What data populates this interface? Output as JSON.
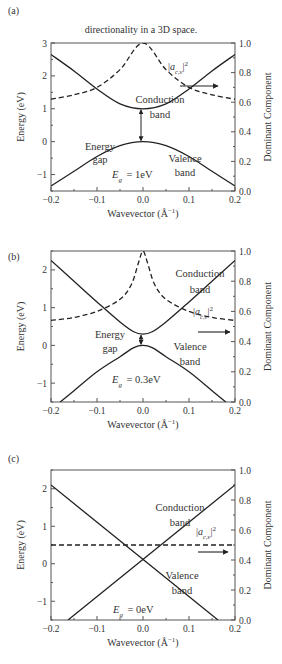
{
  "caption_top": "directionality in a 3D space.",
  "chart_data": [
    {
      "panel": "(a)",
      "type": "line",
      "xlabel": "Wavevector (Å⁻¹)",
      "ylabel": "Energy (eV)",
      "y2label": "Dominant Component",
      "xlim": [
        -0.2,
        0.2
      ],
      "ylim": [
        -1.5,
        3
      ],
      "y2lim": [
        0,
        1
      ],
      "xticks": [
        "-0.2",
        "-0.1",
        "0.0",
        "0.1",
        "0.2"
      ],
      "yticks": [
        "-1",
        "0",
        "1",
        "2",
        "3"
      ],
      "y2ticks": [
        "0.0",
        "0.2",
        "0.4",
        "0.6",
        "0.8",
        "1.0"
      ],
      "gap_eV": 1.0,
      "series": [
        {
          "name": "Conduction band",
          "style": "solid",
          "x": [
            -0.2,
            -0.15,
            -0.1,
            -0.05,
            0,
            0.05,
            0.1,
            0.15,
            0.2
          ],
          "y": [
            2.65,
            2.15,
            1.6,
            1.15,
            1.0,
            1.15,
            1.6,
            2.15,
            2.65
          ]
        },
        {
          "name": "Valence band",
          "style": "solid",
          "x": [
            -0.2,
            -0.15,
            -0.1,
            -0.05,
            0,
            0.05,
            0.1,
            0.15,
            0.2
          ],
          "y": [
            -1.35,
            -0.9,
            -0.45,
            -0.12,
            0.0,
            -0.12,
            -0.45,
            -0.9,
            -1.35
          ]
        },
        {
          "name": "|a_c,v|^2",
          "style": "dashed",
          "axis": "right",
          "x": [
            -0.2,
            -0.15,
            -0.1,
            -0.05,
            0,
            0.05,
            0.1,
            0.15,
            0.2
          ],
          "y": [
            0.62,
            0.65,
            0.7,
            0.82,
            1.0,
            0.82,
            0.7,
            0.65,
            0.62
          ]
        }
      ],
      "labels": {
        "conduction": [
          "Conduction",
          "band"
        ],
        "valence": [
          "Valence",
          "band"
        ],
        "gap": [
          "Energy",
          "gap"
        ],
        "eg": "= 1eV",
        "amp": "|a",
        "amp_sub": "c,v",
        "amp_sup": "2"
      }
    },
    {
      "panel": "(b)",
      "type": "line",
      "xlabel": "Wavevector (Å⁻¹)",
      "ylabel": "Energy (eV)",
      "y2label": "Dominant Component",
      "xlim": [
        -0.2,
        0.2
      ],
      "ylim": [
        -1.5,
        2.5
      ],
      "y2lim": [
        0,
        1
      ],
      "xticks": [
        "-0.2",
        "-0.1",
        "0.0",
        "0.1",
        "0.2"
      ],
      "yticks": [
        "-1",
        "0",
        "1",
        "2"
      ],
      "y2ticks": [
        "0.0",
        "0.2",
        "0.4",
        "0.6",
        "0.8",
        "1.0"
      ],
      "gap_eV": 0.3,
      "series": [
        {
          "name": "Conduction band",
          "style": "solid",
          "x": [
            -0.2,
            -0.15,
            -0.1,
            -0.05,
            -0.02,
            0,
            0.02,
            0.05,
            0.1,
            0.15,
            0.2
          ],
          "y": [
            2.25,
            1.7,
            1.15,
            0.62,
            0.36,
            0.3,
            0.36,
            0.62,
            1.15,
            1.7,
            2.25
          ]
        },
        {
          "name": "Valence band",
          "style": "solid",
          "x": [
            -0.18,
            -0.15,
            -0.1,
            -0.05,
            -0.02,
            0,
            0.02,
            0.05,
            0.1,
            0.15,
            0.18
          ],
          "y": [
            -1.5,
            -1.2,
            -0.7,
            -0.3,
            -0.06,
            0,
            -0.06,
            -0.3,
            -0.7,
            -1.2,
            -1.5
          ]
        },
        {
          "name": "|a_c,v|^2",
          "style": "dashed",
          "axis": "right",
          "x": [
            -0.2,
            -0.15,
            -0.1,
            -0.05,
            -0.025,
            -0.01,
            0,
            0.01,
            0.025,
            0.05,
            0.1,
            0.15,
            0.2
          ],
          "y": [
            0.54,
            0.56,
            0.6,
            0.68,
            0.78,
            0.92,
            1.0,
            0.92,
            0.78,
            0.68,
            0.6,
            0.56,
            0.54
          ]
        }
      ],
      "labels": {
        "conduction": [
          "Conduction",
          "band"
        ],
        "valence": [
          "Valence",
          "band"
        ],
        "gap": [
          "Energy",
          "gap"
        ],
        "eg": "= 0.3eV",
        "amp": "|a",
        "amp_sub": "c,v",
        "amp_sup": "2"
      }
    },
    {
      "panel": "(c)",
      "type": "line",
      "xlabel": "Wavevector (Å⁻¹)",
      "ylabel": "Energy (eV)",
      "y2label": "Dominant Component",
      "xlim": [
        -0.2,
        0.2
      ],
      "ylim": [
        -1.5,
        2.5
      ],
      "y2lim": [
        0,
        1
      ],
      "xticks": [
        "-0.2",
        "-0.1",
        "0.0",
        "0.1",
        "0.2"
      ],
      "yticks": [
        "-1",
        "0",
        "1",
        "2"
      ],
      "y2ticks": [
        "0.0",
        "0.2",
        "0.4",
        "0.6",
        "0.8",
        "1.0"
      ],
      "gap_eV": 0,
      "series": [
        {
          "name": "Band 1",
          "style": "solid",
          "x": [
            -0.2,
            0.163
          ],
          "y": [
            2.1,
            -1.5
          ]
        },
        {
          "name": "Band 2",
          "style": "solid",
          "x": [
            -0.163,
            0.2
          ],
          "y": [
            -1.5,
            2.1
          ]
        },
        {
          "name": "|a_c,v|^2",
          "style": "dashed",
          "axis": "right",
          "x": [
            -0.2,
            0.2
          ],
          "y": [
            0.5,
            0.5
          ]
        }
      ],
      "labels": {
        "conduction": [
          "Conduction",
          "band"
        ],
        "valence": [
          "Valence",
          "band"
        ],
        "eg": "= 0eV",
        "amp": "|a",
        "amp_sub": "c,v",
        "amp_sup": "2"
      }
    }
  ]
}
